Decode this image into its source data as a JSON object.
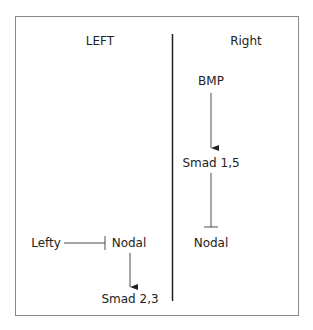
{
  "panels": {
    "left": {
      "heading": "LEFT"
    },
    "right": {
      "heading": "Right"
    }
  },
  "nodes": {
    "bmp": "BMP",
    "smad15": "Smad 1,5",
    "nodal_right": "Nodal",
    "lefty": "Lefty",
    "nodal_left": "Nodal",
    "smad23": "Smad 2,3"
  },
  "edges": [
    {
      "from": "BMP",
      "to": "Smad 1,5",
      "type": "activation"
    },
    {
      "from": "Smad 1,5",
      "to": "Nodal (right)",
      "type": "inhibition"
    },
    {
      "from": "Lefty",
      "to": "Nodal (left)",
      "type": "inhibition"
    },
    {
      "from": "Nodal (left)",
      "to": "Smad 2,3",
      "type": "activation"
    }
  ]
}
